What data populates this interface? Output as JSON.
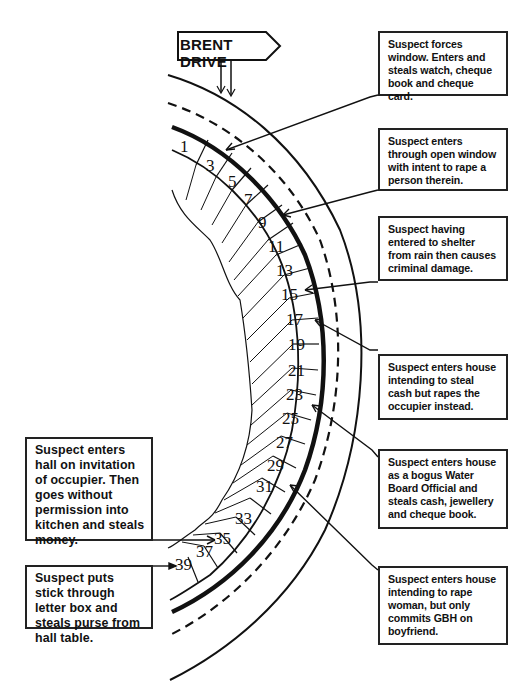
{
  "street_sign": {
    "label": "BRENT DRIVE"
  },
  "house_numbers": [
    "1",
    "3",
    "5",
    "7",
    "9",
    "11",
    "13",
    "15",
    "17",
    "19",
    "21",
    "23",
    "25",
    "27",
    "29",
    "31",
    "33",
    "35",
    "37",
    "39"
  ],
  "scenarios_right": [
    {
      "text": "Suspect forces window. Enters and steals watch, cheque book and cheque card."
    },
    {
      "text": "Suspect enters through open window with intent to rape a person therein."
    },
    {
      "text": "Suspect having entered to shelter from rain then causes criminal damage."
    },
    {
      "text": "Suspect enters house intending to steal cash but rapes the occupier instead."
    },
    {
      "text": "Suspect enters house as a bogus Water Board Official and steals cash, jewellery and cheque book."
    },
    {
      "text": "Suspect enters house intending to rape woman, but only commits GBH on boyfriend."
    }
  ],
  "scenarios_left": [
    {
      "text": "Suspect enters hall on invitation of occupier. Then goes without permission into kitchen and steals money."
    },
    {
      "text": "Suspect puts stick through letter box and steals purse from hall table."
    }
  ],
  "colors": {
    "ink": "#111111",
    "background": "#ffffff"
  }
}
